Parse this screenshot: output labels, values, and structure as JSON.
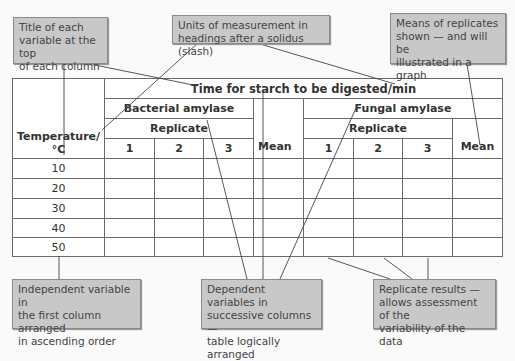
{
  "callouts": {
    "title_variable": {
      "lines": [
        "Title of each",
        "variable at the top",
        "of each column"
      ]
    },
    "units": {
      "lines": [
        "Units of measurement in",
        "headings after a solidus (slash)"
      ]
    },
    "means": {
      "lines": [
        "Means of replicates",
        "shown — and will be",
        "illustrated in a graph"
      ]
    },
    "independent": {
      "lines": [
        "Independent variable in",
        "the first column arranged",
        "in ascending order"
      ]
    },
    "dependent": {
      "lines": [
        "Dependent variables in",
        "successive columns —",
        "table logically arranged"
      ]
    },
    "replicate": {
      "lines": [
        "Replicate results —",
        "allows assessment of the",
        "variability of the data"
      ]
    }
  },
  "table": {
    "title": "Time for starch to be digested/min",
    "first_col_header_line1": "Temperature/",
    "first_col_header_line2": "°C",
    "groups": [
      {
        "name": "Bacterial amylase",
        "replicate_label": "Replicate",
        "replicates": [
          "1",
          "2",
          "3"
        ],
        "mean_label": "Mean"
      },
      {
        "name": "Fungal amylase",
        "replicate_label": "Replicate",
        "replicates": [
          "1",
          "2",
          "3"
        ],
        "mean_label": "Mean"
      }
    ],
    "rows": [
      "10",
      "20",
      "30",
      "40",
      "50"
    ]
  }
}
